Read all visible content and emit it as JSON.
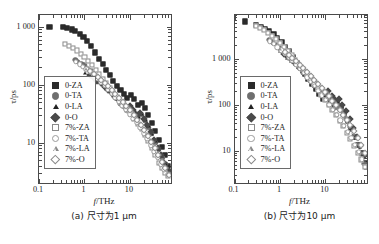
{
  "figure": {
    "panels": [
      {
        "id": "a",
        "caption": "(a) 尺寸为1 μm",
        "xlabel_sym": "f",
        "xlabel_unit": "/THz",
        "ylabel": "τ/ps",
        "xticks": [
          "0.1",
          "1",
          "10"
        ],
        "yticks": [
          "1 000",
          "100",
          "10"
        ]
      },
      {
        "id": "b",
        "caption": "(b) 尺寸为10 μm",
        "xlabel_sym": "f",
        "xlabel_unit": "/THz",
        "ylabel": "τ/ps",
        "xticks": [
          "0.1",
          "1",
          "10"
        ],
        "yticks": [
          "1 000",
          "100",
          "10"
        ]
      }
    ],
    "legend": [
      {
        "label": "0-ZA",
        "marker": "square",
        "fill": "solid",
        "color": "#2b2b2b"
      },
      {
        "label": "0-TA",
        "marker": "circle",
        "fill": "solid",
        "color": "#6e6e6e"
      },
      {
        "label": "0-LA",
        "marker": "triangle",
        "fill": "solid",
        "color": "#232323"
      },
      {
        "label": "0-O",
        "marker": "diamond",
        "fill": "solid",
        "color": "#4a4a4a"
      },
      {
        "label": "7%-ZA",
        "marker": "square",
        "fill": "open",
        "color": "#8a8a8a"
      },
      {
        "label": "7%-TA",
        "marker": "circle",
        "fill": "open",
        "color": "#9a9a9a"
      },
      {
        "label": "7%-LA",
        "marker": "triangle",
        "fill": "open",
        "color": "#8a8a8a"
      },
      {
        "label": "7%-O",
        "marker": "diamond",
        "fill": "open",
        "color": "#8a8a8a"
      }
    ]
  },
  "chart_data": [
    {
      "type": "scatter",
      "title": "(a) 尺寸为1 μm",
      "xlabel": "f/THz",
      "ylabel": "τ/ps",
      "xscale": "log",
      "yscale": "log",
      "xlim": [
        0.1,
        80
      ],
      "ylim": [
        2,
        1600
      ],
      "xticks": [
        0.1,
        1,
        10
      ],
      "yticks": [
        10,
        100,
        1000
      ],
      "grid": false,
      "legend_position": "lower-left-inside",
      "series": [
        {
          "name": "0-ZA",
          "x": [
            0.17,
            0.33,
            0.42,
            0.52,
            0.63,
            0.78,
            0.95,
            1.15,
            1.4,
            1.7,
            2.1,
            2.5,
            3.0,
            3.6,
            4.3,
            5.2,
            6.2,
            7.4,
            8.8,
            10.5,
            12.5,
            15.0,
            18.0,
            21.5,
            25.5,
            30.0,
            36.0,
            43.0,
            51.0,
            60.0,
            70.0
          ],
          "y": [
            1000,
            980,
            950,
            900,
            840,
            760,
            660,
            560,
            460,
            360,
            280,
            225,
            180,
            145,
            118,
            96,
            80,
            68,
            60,
            66,
            56,
            44,
            48,
            40,
            30,
            22,
            16,
            11,
            8.5,
            6.0,
            4.0
          ]
        },
        {
          "name": "0-TA",
          "x": [
            0.63,
            0.72,
            0.85,
            1.0,
            1.2,
            1.45,
            1.75,
            2.1,
            2.5,
            3.0,
            3.6,
            4.3,
            5.2,
            6.2,
            7.4,
            8.8,
            10.5,
            12.5,
            15.0,
            18.0,
            21.5,
            25.5,
            30.0,
            36.0,
            43.0,
            51.0,
            60.0,
            70.0
          ],
          "y": [
            270,
            250,
            230,
            215,
            190,
            170,
            150,
            130,
            112,
            95,
            80,
            68,
            57,
            48,
            41,
            35,
            38,
            32,
            27,
            30,
            24,
            18,
            14,
            10,
            7.5,
            5.5,
            4.2,
            3.2
          ]
        },
        {
          "name": "0-LA",
          "x": [
            1.05,
            1.25,
            1.5,
            1.8,
            2.2,
            2.6,
            3.1,
            3.7,
            4.4,
            5.3,
            6.3,
            7.5,
            9.0,
            10.8,
            13.0,
            15.5,
            18.5,
            22.0,
            26.0,
            31.0,
            37.0,
            44.0,
            52.0,
            62.0,
            72.0
          ],
          "y": [
            160,
            150,
            138,
            125,
            112,
            100,
            88,
            77,
            67,
            58,
            50,
            43,
            37,
            40,
            34,
            28,
            31,
            25,
            19,
            14,
            10.5,
            7.8,
            5.8,
            4.3,
            3.3
          ]
        },
        {
          "name": "0-O",
          "x": [
            1.3,
            1.6,
            1.9,
            2.3,
            2.8,
            3.3,
            4.0,
            4.8,
            5.7,
            6.8,
            8.2,
            9.8,
            11.7,
            14.0,
            16.8,
            20.0,
            24.0,
            28.5,
            34.0,
            40.5,
            48.0,
            57.0,
            68.0
          ],
          "y": [
            145,
            130,
            118,
            105,
            93,
            82,
            72,
            62,
            54,
            46,
            40,
            43,
            36,
            30,
            33,
            26,
            20,
            15,
            11,
            8.2,
            6.0,
            4.5,
            3.4
          ]
        },
        {
          "name": "7%-ZA",
          "x": [
            0.38,
            0.46,
            0.56,
            0.68,
            0.82,
            1.0,
            1.2,
            1.45,
            1.75,
            2.1,
            2.5,
            3.0,
            3.6,
            4.3,
            5.2,
            6.2,
            7.4,
            8.8,
            10.5,
            12.5,
            15.0,
            18.0,
            21.5,
            25.5,
            30.0,
            36.0,
            43.0,
            51.0,
            60.0,
            70.0
          ],
          "y": [
            500,
            470,
            430,
            390,
            345,
            300,
            255,
            215,
            180,
            150,
            125,
            105,
            88,
            73,
            61,
            51,
            43,
            36,
            31,
            26,
            21,
            17,
            13.5,
            10.5,
            8.0,
            6.0,
            4.5,
            3.6,
            3.0,
            2.6
          ]
        },
        {
          "name": "7%-TA",
          "x": [
            0.64,
            0.78,
            0.92,
            1.1,
            1.32,
            1.6,
            1.9,
            2.3,
            2.8,
            3.3,
            4.0,
            4.8,
            5.7,
            6.8,
            8.2,
            9.8,
            11.7,
            14.0,
            16.8,
            20.0,
            24.0,
            28.5,
            34.0,
            40.5,
            48.0,
            57.0,
            68.0
          ],
          "y": [
            250,
            225,
            205,
            185,
            165,
            145,
            128,
            110,
            95,
            82,
            70,
            60,
            51,
            43,
            37,
            31,
            26,
            22,
            18,
            14.5,
            11.5,
            9.0,
            7.0,
            5.4,
            4.2,
            3.4,
            2.8
          ]
        },
        {
          "name": "7%-LA",
          "x": [
            1.08,
            1.3,
            1.55,
            1.85,
            2.25,
            2.7,
            3.2,
            3.8,
            4.6,
            5.5,
            6.6,
            7.9,
            9.5,
            11.4,
            13.7,
            16.4,
            19.6,
            23.5,
            28.0,
            33.5,
            40.0,
            48.0,
            57.0,
            68.0
          ],
          "y": [
            185,
            168,
            152,
            136,
            120,
            105,
            92,
            80,
            69,
            59,
            50,
            43,
            36,
            30,
            25,
            21,
            17,
            13.5,
            10.5,
            8.2,
            6.3,
            4.8,
            3.8,
            3.0
          ]
        },
        {
          "name": "7%-O",
          "x": [
            1.35,
            1.62,
            1.95,
            2.35,
            2.8,
            3.35,
            4.0,
            4.8,
            5.8,
            6.9,
            8.3,
            10.0,
            12.0,
            14.4,
            17.2,
            20.6,
            24.6,
            29.5,
            35.0,
            42.0,
            50.0,
            60.0,
            72.0
          ],
          "y": [
            170,
            152,
            136,
            121,
            107,
            94,
            82,
            70,
            60,
            51,
            43,
            36,
            30,
            25,
            20.5,
            16.5,
            13.0,
            10.2,
            7.9,
            6.0,
            4.6,
            3.6,
            2.8
          ]
        }
      ]
    },
    {
      "type": "scatter",
      "title": "(b) 尺寸为10 μm",
      "xlabel": "f/THz",
      "ylabel": "τ/ps",
      "xscale": "log",
      "yscale": "log",
      "xlim": [
        0.1,
        80
      ],
      "ylim": [
        2,
        9000
      ],
      "xticks": [
        0.1,
        1,
        10
      ],
      "yticks": [
        10,
        100,
        1000
      ],
      "grid": false,
      "legend_position": "middle-left-inside",
      "series": [
        {
          "name": "0-ZA",
          "x": [
            0.17,
            0.3,
            0.38,
            0.47,
            0.58,
            0.72,
            0.88,
            1.08,
            1.32,
            1.6,
            1.95,
            2.4,
            2.9,
            3.5,
            4.2,
            5.1,
            6.1,
            7.3,
            8.8,
            10.5,
            12.6,
            15.1,
            18.1,
            21.7,
            26.0,
            31.0,
            37.0,
            44.5,
            53.0,
            63.0,
            74.0
          ],
          "y": [
            6500,
            5400,
            5000,
            4500,
            4000,
            3400,
            2800,
            2300,
            1850,
            1450,
            1100,
            830,
            630,
            480,
            370,
            285,
            220,
            170,
            135,
            150,
            120,
            95,
            105,
            85,
            62,
            44,
            30,
            20,
            13.5,
            9.0,
            5.5
          ]
        },
        {
          "name": "0-TA",
          "x": [
            0.58,
            0.7,
            0.85,
            1.02,
            1.25,
            1.5,
            1.82,
            2.2,
            2.65,
            3.2,
            3.85,
            4.6,
            5.6,
            6.7,
            8.0,
            9.6,
            11.5,
            13.8,
            16.6,
            20.0,
            24.0,
            28.8,
            34.5,
            41.5,
            49.5,
            59.5,
            71.0
          ],
          "y": [
            2600,
            2300,
            2000,
            1700,
            1420,
            1180,
            970,
            790,
            640,
            515,
            415,
            330,
            262,
            208,
            165,
            130,
            140,
            112,
            88,
            96,
            72,
            50,
            33,
            21,
            13.5,
            8.5,
            5.2
          ]
        },
        {
          "name": "0-LA",
          "x": [
            1.0,
            1.2,
            1.45,
            1.75,
            2.1,
            2.55,
            3.05,
            3.7,
            4.45,
            5.35,
            6.4,
            7.7,
            9.2,
            11.1,
            13.3,
            16.0,
            19.2,
            23.0,
            27.6,
            33.0,
            39.6,
            47.5,
            57.0,
            68.0
          ],
          "y": [
            1450,
            1250,
            1070,
            910,
            770,
            650,
            545,
            455,
            378,
            312,
            256,
            210,
            172,
            185,
            148,
            117,
            125,
            95,
            68,
            46,
            30,
            19,
            12,
            7.5
          ]
        },
        {
          "name": "0-O",
          "x": [
            1.25,
            1.5,
            1.8,
            2.18,
            2.6,
            3.15,
            3.8,
            4.55,
            5.5,
            6.6,
            7.9,
            9.5,
            11.4,
            13.7,
            16.4,
            19.7,
            23.6,
            28.3,
            34.0,
            40.8,
            49.0,
            58.5,
            70.0
          ],
          "y": [
            1300,
            1120,
            960,
            815,
            690,
            580,
            485,
            405,
            335,
            276,
            226,
            185,
            198,
            158,
            125,
            132,
            100,
            72,
            49,
            32,
            20,
            12.5,
            7.8
          ]
        },
        {
          "name": "7%-ZA",
          "x": [
            0.3,
            0.37,
            0.45,
            0.55,
            0.67,
            0.82,
            1.0,
            1.22,
            1.48,
            1.8,
            2.18,
            2.65,
            3.2,
            3.85,
            4.65,
            5.6,
            6.75,
            8.1,
            9.8,
            11.7,
            14.1,
            17.0,
            20.4,
            24.5,
            29.4,
            35.3,
            42.4,
            51.0,
            61.0,
            73.0
          ],
          "y": [
            5200,
            4700,
            4200,
            3700,
            3200,
            2700,
            2250,
            1850,
            1500,
            1200,
            950,
            750,
            590,
            460,
            360,
            280,
            218,
            168,
            130,
            100,
            77,
            59,
            45,
            34,
            25,
            18,
            13,
            9.2,
            6.5,
            4.5
          ]
        },
        {
          "name": "7%-TA",
          "x": [
            0.6,
            0.73,
            0.88,
            1.06,
            1.28,
            1.55,
            1.88,
            2.27,
            2.74,
            3.3,
            4.0,
            4.8,
            5.8,
            7.0,
            8.4,
            10.1,
            12.2,
            14.7,
            17.7,
            21.3,
            25.6,
            30.8,
            37.0,
            44.5,
            53.5,
            64.0
          ],
          "y": [
            2400,
            2100,
            1800,
            1540,
            1300,
            1090,
            905,
            745,
            610,
            495,
            400,
            322,
            258,
            205,
            162,
            128,
            100,
            78,
            60,
            46,
            35,
            26,
            19,
            13.5,
            9.5,
            6.5
          ]
        },
        {
          "name": "7%-LA",
          "x": [
            1.02,
            1.23,
            1.48,
            1.78,
            2.15,
            2.6,
            3.12,
            3.75,
            4.5,
            5.4,
            6.5,
            7.8,
            9.4,
            11.3,
            13.6,
            16.3,
            19.6,
            23.5,
            28.2,
            33.9,
            40.7,
            48.8,
            58.5,
            70.0
          ],
          "y": [
            1600,
            1380,
            1180,
            1000,
            845,
            710,
            595,
            495,
            410,
            338,
            277,
            226,
            184,
            149,
            120,
            96,
            76,
            60,
            46,
            35,
            26,
            19,
            13,
            8.8
          ]
        },
        {
          "name": "7%-O",
          "x": [
            1.3,
            1.56,
            1.88,
            2.26,
            2.72,
            3.27,
            3.93,
            4.72,
            5.67,
            6.8,
            8.2,
            9.8,
            11.8,
            14.2,
            17.0,
            20.4,
            24.5,
            29.4,
            35.3,
            42.4,
            51.0,
            61.0,
            73.0
          ],
          "y": [
            1420,
            1220,
            1040,
            880,
            742,
            622,
            519,
            430,
            355,
            291,
            237,
            192,
            155,
            124,
            99,
            78,
            61,
            47,
            36,
            27,
            19.5,
            13.5,
            9.0
          ]
        }
      ]
    }
  ]
}
